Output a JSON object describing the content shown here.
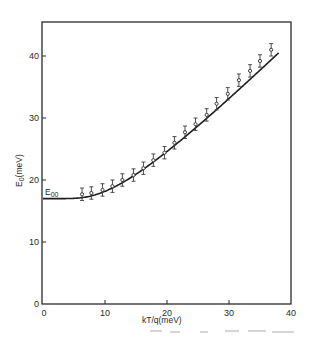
{
  "chart_data": {
    "type": "scatter",
    "title": "",
    "xlabel": "kT/q(meV)",
    "ylabel_main": "E",
    "ylabel_sub": "0",
    "ylabel_unit": "(meV)",
    "xlim": [
      0,
      40
    ],
    "ylim": [
      0,
      45
    ],
    "x_ticks": [
      0,
      10,
      20,
      30,
      40
    ],
    "y_ticks": [
      0,
      10,
      20,
      30,
      40
    ],
    "x_tick_labels": [
      "0",
      "10",
      "20",
      "30",
      "40"
    ],
    "y_tick_labels": [
      "0",
      "10",
      "20",
      "30",
      "40"
    ],
    "grid": false,
    "legend": "none",
    "annotation": {
      "main": "E",
      "sub": "00",
      "x": 0,
      "y": 17
    },
    "series": [
      {
        "name": "measured",
        "marker": "open-circle",
        "x": [
          6.3,
          7.8,
          9.6,
          11.2,
          12.8,
          14.6,
          16.2,
          17.8,
          19.6,
          21.2,
          22.9,
          24.6,
          26.4,
          28.0,
          29.8,
          31.6,
          33.4,
          35.0,
          36.8
        ],
        "y": [
          17.7,
          17.9,
          18.4,
          19.0,
          20.0,
          20.8,
          21.9,
          23.2,
          24.4,
          26.0,
          27.7,
          29.0,
          30.5,
          32.3,
          33.9,
          36.1,
          37.6,
          39.2,
          41.0
        ],
        "error": 1.0
      },
      {
        "name": "fit",
        "type": "line",
        "model": "E00*coth(E00/kT)",
        "E00": 17,
        "x_range": [
          0,
          38
        ]
      }
    ]
  }
}
